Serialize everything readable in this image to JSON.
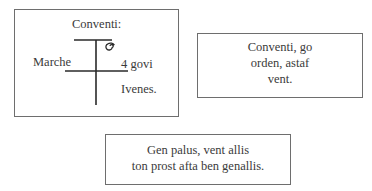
{
  "diagram": {
    "box1": {
      "title": "Conventi:",
      "left_label": "Marche",
      "right_label": "4 govi",
      "bottom_label": "Ivenes."
    },
    "box2": {
      "lines": [
        "Conventi, go",
        "orden, astaf",
        "vent."
      ]
    },
    "box3": {
      "lines": [
        "Gen palus, vent allis",
        "ton prost afta ben genallis."
      ]
    }
  },
  "colors": {
    "border": "#6e6e6e",
    "text": "#3a3a3a",
    "line": "#2a2a2a"
  }
}
